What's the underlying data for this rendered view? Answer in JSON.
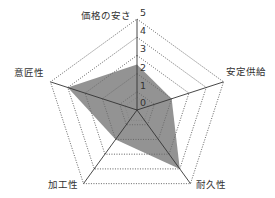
{
  "chart_data": {
    "type": "radar",
    "title": "",
    "categories": [
      "価格の安さ",
      "安定供給",
      "耐久性",
      "加工性",
      "意匠性"
    ],
    "series": [
      {
        "name": "",
        "values": [
          2.5,
          2,
          4,
          2,
          4
        ],
        "fill": "#7f7f7f"
      }
    ],
    "radial_ticks": [
      "0",
      "1",
      "2",
      "3",
      "4",
      "5"
    ],
    "rlim": [
      0,
      5
    ],
    "grid": "dotted",
    "legend": "none"
  },
  "colors": {
    "fill": "#808080",
    "axis": "#333333",
    "grid": "#666666"
  }
}
